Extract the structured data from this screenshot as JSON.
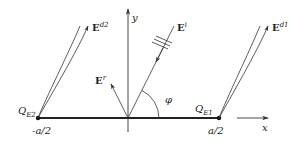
{
  "diagram": {
    "type": "physics-geometry",
    "colors": {
      "stroke": "#333333",
      "background": "#ffffff"
    },
    "axes": {
      "x_label": "x",
      "y_label": "y"
    },
    "strip": {
      "left_end_label": "-a/2",
      "right_end_label": "a/2"
    },
    "edges": [
      {
        "id": "QE2",
        "label_main": "Q",
        "label_sub": "E2"
      },
      {
        "id": "QE1",
        "label_main": "Q",
        "label_sub": "E1"
      }
    ],
    "fields": {
      "incident": {
        "main": "E",
        "sup": "i"
      },
      "reflected": {
        "main": "E",
        "sup": "r"
      },
      "diffracted_1": {
        "main": "E",
        "sup": "d1"
      },
      "diffracted_2": {
        "main": "E",
        "sup": "d2"
      }
    },
    "angle": {
      "label": "φ"
    }
  }
}
